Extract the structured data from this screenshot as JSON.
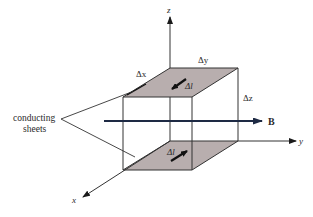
{
  "diagram": {
    "axes": {
      "x": "x",
      "y": "y",
      "z": "z"
    },
    "dimensions": {
      "dx": "Δx",
      "dy": "Δy",
      "dz": "Δz"
    },
    "current_element": {
      "top": "Δl",
      "bottom": "Δl"
    },
    "field_label": "B",
    "callout": {
      "line1": "conducting",
      "line2": "sheets"
    },
    "colors": {
      "sheet_fill": "#b8aeae",
      "line": "#333333",
      "arrow": "#1a1a1a",
      "field_arrow": "#1e2a44"
    }
  }
}
